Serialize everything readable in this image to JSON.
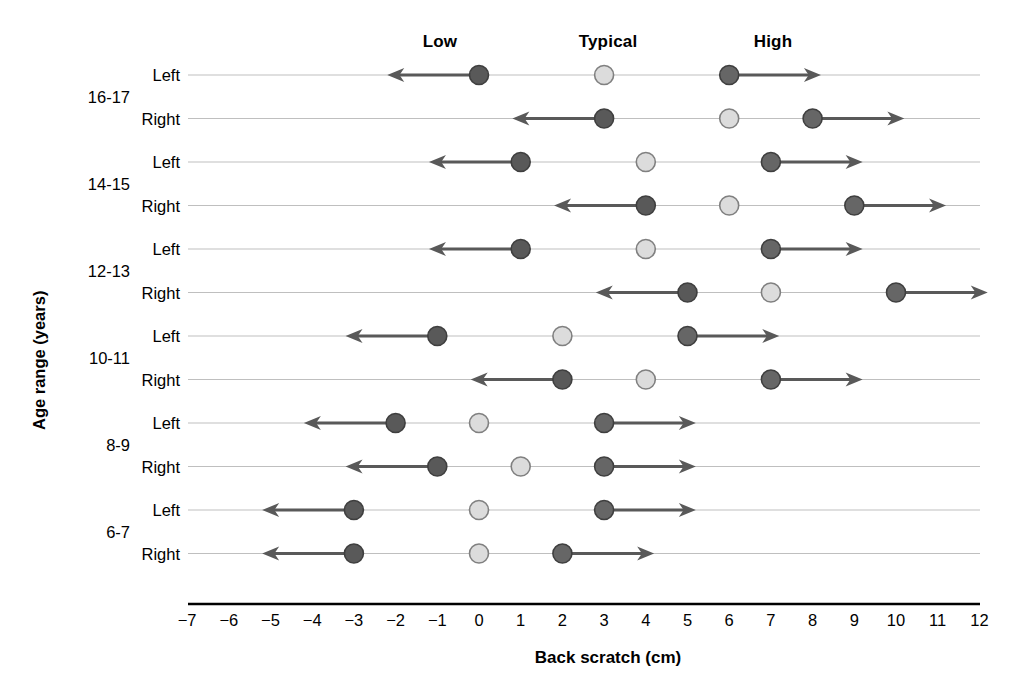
{
  "chart_data": {
    "type": "scatter",
    "title": "",
    "xlabel": "Back scratch (cm)",
    "ylabel": "Age range (years)",
    "xlim": [
      -7,
      12
    ],
    "xticks": [
      "−7",
      "−6",
      "−5",
      "−4",
      "−3",
      "−2",
      "−1",
      "0",
      "1",
      "2",
      "3",
      "4",
      "5",
      "6",
      "7",
      "8",
      "9",
      "10",
      "11",
      "12"
    ],
    "xtick_values": [
      -7,
      -6,
      -5,
      -4,
      -3,
      -2,
      -1,
      0,
      1,
      2,
      3,
      4,
      5,
      6,
      7,
      8,
      9,
      10,
      11,
      12
    ],
    "grid": true,
    "legend_position": "top",
    "column_headers": [
      {
        "label": "Low",
        "value": -2,
        "color": "#595959"
      },
      {
        "label": "Typical",
        "value": 3,
        "color": "#d9d9d9"
      },
      {
        "label": "High",
        "value": 6,
        "color": "#666666"
      }
    ],
    "series": [
      {
        "name": "Low",
        "marker": "circle-dark-arrow-left",
        "fill": "#595959",
        "stroke": "#3f3f3f"
      },
      {
        "name": "Typical",
        "marker": "circle-light",
        "fill": "#dcdcdc",
        "stroke": "#808080"
      },
      {
        "name": "High",
        "marker": "circle-dark-arrow-right",
        "fill": "#666666",
        "stroke": "#3f3f3f"
      }
    ],
    "age_groups": [
      "16-17",
      "14-15",
      "12-13",
      "10-11",
      "8-9",
      "6-7"
    ],
    "rows": [
      {
        "age_range": "16-17",
        "side": "Left",
        "low": 0,
        "typical": 3,
        "high": 6
      },
      {
        "age_range": "16-17",
        "side": "Right",
        "low": 3,
        "typical": 6,
        "high": 8
      },
      {
        "age_range": "14-15",
        "side": "Left",
        "low": 1,
        "typical": 4,
        "high": 7
      },
      {
        "age_range": "14-15",
        "side": "Right",
        "low": 4,
        "typical": 6,
        "high": 9
      },
      {
        "age_range": "12-13",
        "side": "Left",
        "low": 1,
        "typical": 4,
        "high": 7
      },
      {
        "age_range": "12-13",
        "side": "Right",
        "low": 5,
        "typical": 7,
        "high": 10
      },
      {
        "age_range": "10-11",
        "side": "Left",
        "low": -1,
        "typical": 2,
        "high": 5
      },
      {
        "age_range": "10-11",
        "side": "Right",
        "low": 2,
        "typical": 4,
        "high": 7
      },
      {
        "age_range": "8-9",
        "side": "Left",
        "low": -2,
        "typical": 0,
        "high": 3
      },
      {
        "age_range": "8-9",
        "side": "Right",
        "low": -1,
        "typical": 1,
        "high": 3
      },
      {
        "age_range": "6-7",
        "side": "Left",
        "low": -3,
        "typical": 0,
        "high": 3
      },
      {
        "age_range": "6-7",
        "side": "Right",
        "low": -3,
        "typical": 0,
        "high": 2
      }
    ],
    "arrow_span": 2.2,
    "colors": {
      "low_marker": "#595959",
      "typical_marker": "#dcdcdc",
      "high_marker": "#666666",
      "marker_edge": "#3f3f3f",
      "typical_edge": "#808080",
      "arrow": "#595959",
      "gridline": "#bfbfbf",
      "axis": "#000000",
      "background": "#ffffff"
    }
  }
}
